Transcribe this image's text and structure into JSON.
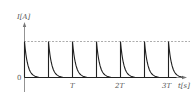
{
  "chart_data": {
    "type": "line",
    "title": "",
    "ylabel": "I[A]",
    "xlabel": "t[s]",
    "y_origin_label": "0",
    "x_tick_labels": [
      "T",
      "2T",
      "3T"
    ],
    "x_ticks_in_periods": [
      2,
      4,
      6
    ],
    "period": "T/2",
    "pulse_count": 7,
    "pulse_start_times_in_T": [
      0,
      0.5,
      1,
      1.5,
      2,
      2.5,
      3
    ],
    "peak_level": "I0 (dashed reference line)",
    "waveform": "exponential decay spikes: current jumps to peak then decays to 0 within each half-period",
    "grid": false,
    "legend": null
  },
  "axes": {
    "y_label": "I[A]",
    "x_label": "t[s]",
    "origin": "0",
    "ticks": [
      "T",
      "2T",
      "3T"
    ]
  },
  "colors": {
    "curve": "#222222",
    "axis": "#666666",
    "dashed": "#888888"
  }
}
